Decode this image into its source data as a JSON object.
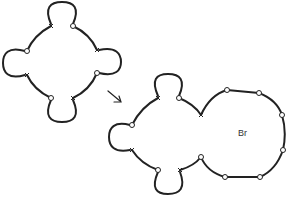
{
  "diagram": {
    "label_br": "Br",
    "marker_x": "x",
    "marker_o": "o",
    "arrow": "→",
    "colors": {
      "stroke": "#222222",
      "text": "#333333"
    }
  }
}
